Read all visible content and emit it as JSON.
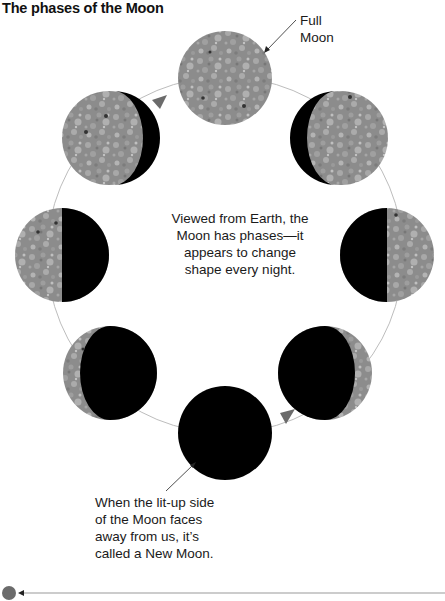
{
  "title": "The phases of the Moon",
  "labels": {
    "full_moon_line1": "Full",
    "full_moon_line2": "Moon",
    "center_line1": "Viewed from Earth, the",
    "center_line2": "Moon has phases—it",
    "center_line3": "appears to change",
    "center_line4": "shape every night.",
    "new_moon_line1": "When the lit-up side",
    "new_moon_line2": "of the Moon faces",
    "new_moon_line3": "away from us, it’s",
    "new_moon_line4": "called a New Moon."
  },
  "phases": [
    {
      "name": "Full Moon",
      "position": "top"
    },
    {
      "name": "Waning Gibbous",
      "position": "top-left"
    },
    {
      "name": "Third Quarter",
      "position": "left"
    },
    {
      "name": "Waning Crescent",
      "position": "bottom-left"
    },
    {
      "name": "New Moon",
      "position": "bottom"
    },
    {
      "name": "Waxing Crescent",
      "position": "bottom-right"
    },
    {
      "name": "First Quarter",
      "position": "right"
    },
    {
      "name": "Waxing Gibbous",
      "position": "top-right"
    }
  ],
  "colors": {
    "moon_surface": "#8a8a8a",
    "moon_shadow": "#000000",
    "orbit": "#bdbdbd",
    "arrow": "#6b6b6b"
  }
}
